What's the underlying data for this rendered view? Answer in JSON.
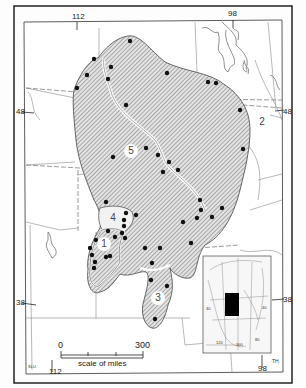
{
  "map": {
    "type": "species distribution map",
    "top_ticks": [
      {
        "label": "112",
        "x": 77
      },
      {
        "label": "98",
        "x": 233
      }
    ],
    "bottom_ticks": [
      {
        "label": "112",
        "x": 55
      },
      {
        "label": "98",
        "x": 265
      }
    ],
    "left_ticks": [
      {
        "label": "48",
        "y": 112
      },
      {
        "label": "38",
        "y": 303
      }
    ],
    "right_ticks": [
      {
        "label": "48",
        "y": 112
      },
      {
        "label": "38",
        "y": 303
      }
    ],
    "regions": [
      {
        "id": "1",
        "label": "1"
      },
      {
        "id": "2",
        "label": "2"
      },
      {
        "id": "3",
        "label": "3"
      },
      {
        "id": "4",
        "label": "4"
      },
      {
        "id": "5",
        "label": "5"
      }
    ],
    "scale": {
      "start": "0",
      "end": "300",
      "caption": "scale of miles"
    },
    "inset": {
      "description": "North America locator map",
      "labels": [
        "120",
        "100",
        "40",
        "80",
        "40"
      ]
    },
    "credit_left": "SLU",
    "credit_right": "TH"
  }
}
